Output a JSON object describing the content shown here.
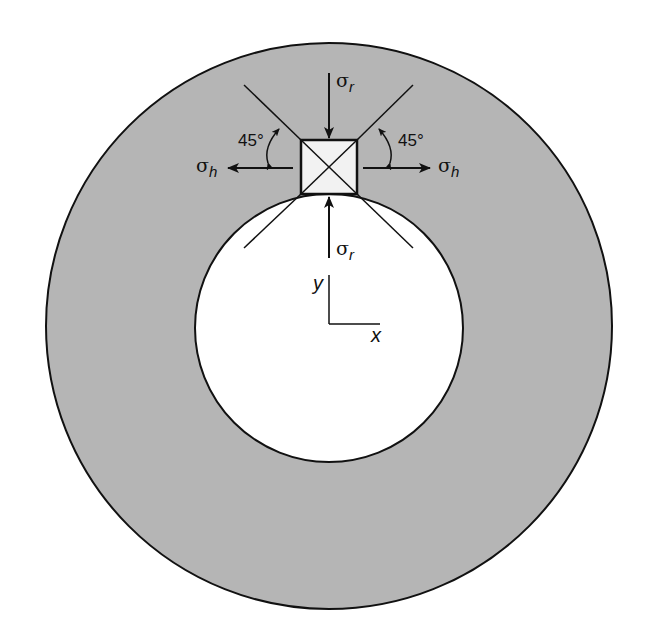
{
  "figure": {
    "colors": {
      "wall_fill": "#b5b5b5",
      "bore_fill": "#ffffff",
      "stroke": "#111111",
      "element_fill": "#f2f2f2"
    },
    "outer_circle": {
      "cx": 329,
      "cy": 326,
      "r": 283
    },
    "inner_circle": {
      "cx": 329,
      "cy": 326,
      "r": 133
    },
    "element": {
      "x": 301,
      "y": 140,
      "width": 56,
      "height": 54
    }
  },
  "labels": {
    "sigma_r_top": {
      "symbol": "σ",
      "subscript": "r"
    },
    "sigma_r_bottom": {
      "symbol": "σ",
      "subscript": "r"
    },
    "sigma_h_left": {
      "symbol": "σ",
      "subscript": "h"
    },
    "sigma_h_right": {
      "symbol": "σ",
      "subscript": "h"
    },
    "angle_left": "45°",
    "angle_right": "45°",
    "axis_x": "x",
    "axis_y": "y"
  }
}
